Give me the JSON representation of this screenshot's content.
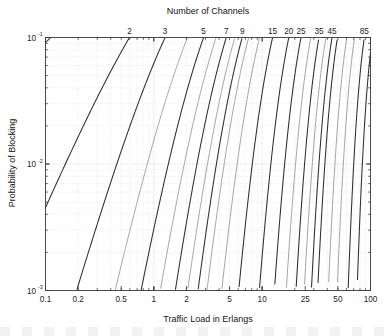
{
  "chart_data": {
    "type": "line",
    "title": "",
    "xlabel": "Traffic Load in Erlangs",
    "ylabel": "Probability of Blocking",
    "top_axis_label": "Number of Channels",
    "xscale": "log",
    "yscale": "log",
    "xlim": [
      0.1,
      100
    ],
    "ylim": [
      0.001,
      0.1
    ],
    "grid": true,
    "legend_position": "top-axis-annotations",
    "x_tick_labels": [
      "0.1",
      "0.2",
      "0.5",
      "1",
      "2",
      "5",
      "10",
      "25",
      "50",
      "100"
    ],
    "x_tick_values": [
      0.1,
      0.2,
      0.5,
      1,
      2,
      5,
      10,
      25,
      50,
      100
    ],
    "y_tick_labels": [
      "10-1",
      "10-2",
      "10-3"
    ],
    "y_tick_mantissa": "10",
    "y_tick_exponents": [
      "-1",
      "-2",
      "-3"
    ],
    "y_tick_values": [
      0.1,
      0.01,
      0.001
    ],
    "top_tick_labels": [
      "2",
      "3",
      "5",
      "7",
      "9",
      "15",
      "20",
      "25",
      "35",
      "45",
      "85"
    ],
    "series_channels": [
      1,
      2,
      3,
      4,
      5,
      6,
      7,
      8,
      9,
      10,
      12,
      15,
      20,
      25,
      30,
      35,
      40,
      45,
      50,
      60,
      70,
      85,
      100
    ],
    "labeled_channels": [
      2,
      3,
      5,
      7,
      9,
      15,
      20,
      25,
      35,
      45,
      85
    ],
    "curve_color_dark": "#2e2e2e",
    "curve_color_light": "#9a9a9a",
    "axis_color": "#3a3a3a",
    "grid_color": "#c8c8c8"
  }
}
